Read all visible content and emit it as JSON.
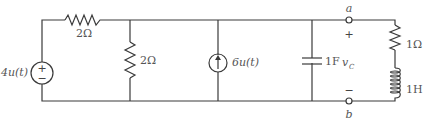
{
  "diagram": {
    "type": "circuit-schematic",
    "components": {
      "voltage_source": {
        "label": "4u(t)",
        "polarity_top": "+",
        "polarity_bottom": "−"
      },
      "series_resistor": {
        "label": "2Ω"
      },
      "shunt_resistor": {
        "label": "2Ω"
      },
      "current_source": {
        "label": "6u(t)",
        "direction": "up"
      },
      "capacitor": {
        "label": "1F"
      },
      "load_resistor": {
        "label": "1Ω"
      },
      "inductor": {
        "label": "1H"
      }
    },
    "terminals": {
      "top": {
        "label": "a",
        "sign": "+"
      },
      "bottom": {
        "label": "b",
        "sign": "−"
      }
    },
    "voltage_label": "v",
    "voltage_subscript": "C"
  },
  "colors": {
    "wire": "#3a3a3a",
    "text": "#555555",
    "background": "#ffffff"
  }
}
